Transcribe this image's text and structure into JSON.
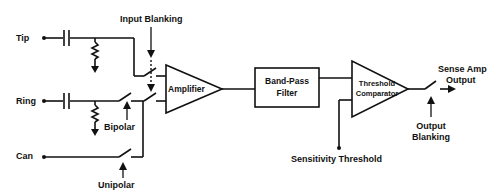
{
  "diagram": {
    "inputs": {
      "tip": "Tip",
      "ring": "Ring",
      "can": "Can"
    },
    "controls": {
      "input_blanking": "Input Blanking",
      "bipolar": "Bipolar",
      "unipolar": "Unipolar",
      "sensitivity_threshold": "Sensitivity Threshold",
      "output_blanking_line1": "Output",
      "output_blanking_line2": "Blanking"
    },
    "blocks": {
      "amplifier": "Amplifier",
      "bandpass_line1": "Band-Pass",
      "bandpass_line2": "Filter",
      "comparator_line1": "Threshold",
      "comparator_line2": "Comparator"
    },
    "output": {
      "line1": "Sense Amp",
      "line2": "Output"
    },
    "colors": {
      "line": "#111111",
      "background": "#ffffff"
    }
  }
}
